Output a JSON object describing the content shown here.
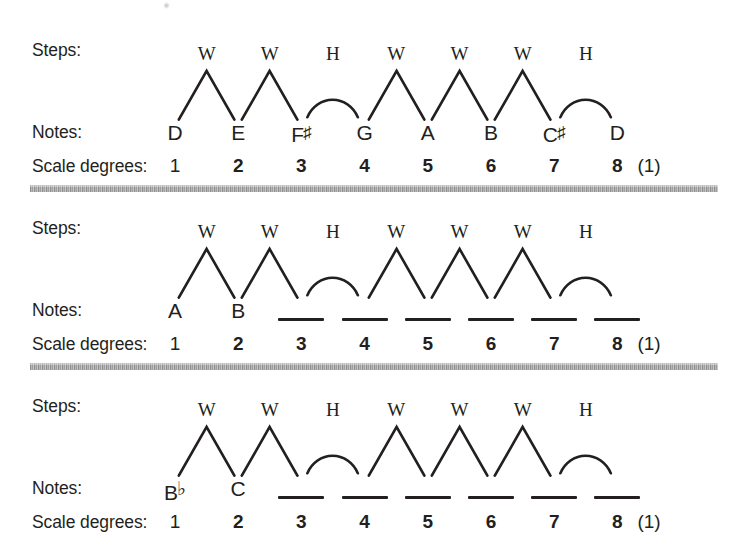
{
  "figure": {
    "ink_color": "#231f20",
    "divider_color": "#9a9a9a",
    "background": "#ffffff"
  },
  "labels": {
    "steps": "Steps:",
    "notes": "Notes:",
    "scale_degrees": "Scale degrees:",
    "octave_note": "(1)"
  },
  "step_pattern": {
    "sequence": [
      "W",
      "W",
      "H",
      "W",
      "W",
      "W",
      "H"
    ],
    "whole_symbol": "W",
    "half_symbol": "H",
    "whole_shape": "peak",
    "half_shape": "arc"
  },
  "degrees": [
    "1",
    "2",
    "3",
    "4",
    "5",
    "6",
    "7",
    "8"
  ],
  "blocks": [
    {
      "id": "d-major",
      "key": "D major",
      "steps": [
        "W",
        "W",
        "H",
        "W",
        "W",
        "W",
        "H"
      ],
      "notes": [
        {
          "letter": "D",
          "accidental": ""
        },
        {
          "letter": "E",
          "accidental": ""
        },
        {
          "letter": "F",
          "accidental": "♯"
        },
        {
          "letter": "G",
          "accidental": ""
        },
        {
          "letter": "A",
          "accidental": ""
        },
        {
          "letter": "B",
          "accidental": ""
        },
        {
          "letter": "C",
          "accidental": "♯"
        },
        {
          "letter": "D",
          "accidental": ""
        }
      ],
      "degrees": [
        "1",
        "2",
        "3",
        "4",
        "5",
        "6",
        "7",
        "8"
      ],
      "octave_note": "(1)"
    },
    {
      "id": "a-major",
      "key": "A major",
      "steps": [
        "W",
        "W",
        "H",
        "W",
        "W",
        "W",
        "H"
      ],
      "notes": [
        {
          "letter": "A",
          "accidental": ""
        },
        {
          "letter": "B",
          "accidental": ""
        },
        {
          "letter": "",
          "accidental": ""
        },
        {
          "letter": "",
          "accidental": ""
        },
        {
          "letter": "",
          "accidental": ""
        },
        {
          "letter": "",
          "accidental": ""
        },
        {
          "letter": "",
          "accidental": ""
        },
        {
          "letter": "",
          "accidental": ""
        }
      ],
      "degrees": [
        "1",
        "2",
        "3",
        "4",
        "5",
        "6",
        "7",
        "8"
      ],
      "octave_note": "(1)"
    },
    {
      "id": "b-flat-major",
      "key": "B-flat major",
      "steps": [
        "W",
        "W",
        "H",
        "W",
        "W",
        "W",
        "H"
      ],
      "notes": [
        {
          "letter": "B",
          "accidental": "♭"
        },
        {
          "letter": "C",
          "accidental": ""
        },
        {
          "letter": "",
          "accidental": ""
        },
        {
          "letter": "",
          "accidental": ""
        },
        {
          "letter": "",
          "accidental": ""
        },
        {
          "letter": "",
          "accidental": ""
        },
        {
          "letter": "",
          "accidental": ""
        },
        {
          "letter": "",
          "accidental": ""
        }
      ],
      "degrees": [
        "1",
        "2",
        "3",
        "4",
        "5",
        "6",
        "7",
        "8"
      ],
      "octave_note": "(1)"
    }
  ]
}
